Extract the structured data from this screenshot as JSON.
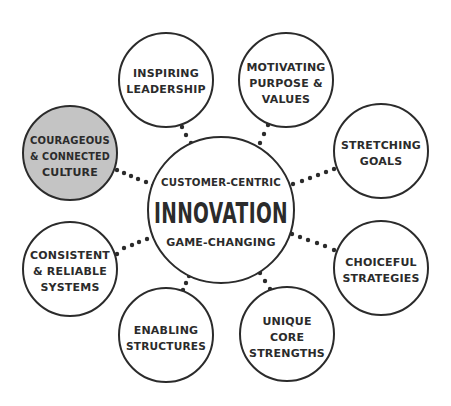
{
  "diagram": {
    "center": {
      "top": "CUSTOMER-CENTRIC",
      "title": "INNOVATION",
      "bottom": "GAME-CHANGING"
    },
    "nodes": [
      {
        "id": "inspiring-leadership",
        "lines": [
          "INSPIRING",
          "LEADERSHIP"
        ]
      },
      {
        "id": "motivating-purpose",
        "lines": [
          "MOTIVATING",
          "PURPOSE &",
          "VALUES"
        ]
      },
      {
        "id": "stretching-goals",
        "lines": [
          "STRETCHING",
          "GOALS"
        ]
      },
      {
        "id": "choiceful-strategies",
        "lines": [
          "CHOICEFUL",
          "STRATEGIES"
        ]
      },
      {
        "id": "unique-core-strengths",
        "lines": [
          "UNIQUE",
          "CORE",
          "STRENGTHS"
        ]
      },
      {
        "id": "enabling-structures",
        "lines": [
          "ENABLING",
          "STRUCTURES"
        ]
      },
      {
        "id": "consistent-reliable-systems",
        "lines": [
          "CONSISTENT",
          "& RELIABLE",
          "SYSTEMS"
        ]
      },
      {
        "id": "courageous-connected-culture",
        "lines": [
          "COURAGEOUS",
          "& CONNECTED",
          "CULTURE"
        ],
        "highlighted": true
      }
    ],
    "colors": {
      "stroke": "#2b2b2b",
      "highlight_fill": "#c4c4c4",
      "background": "#ffffff"
    }
  }
}
